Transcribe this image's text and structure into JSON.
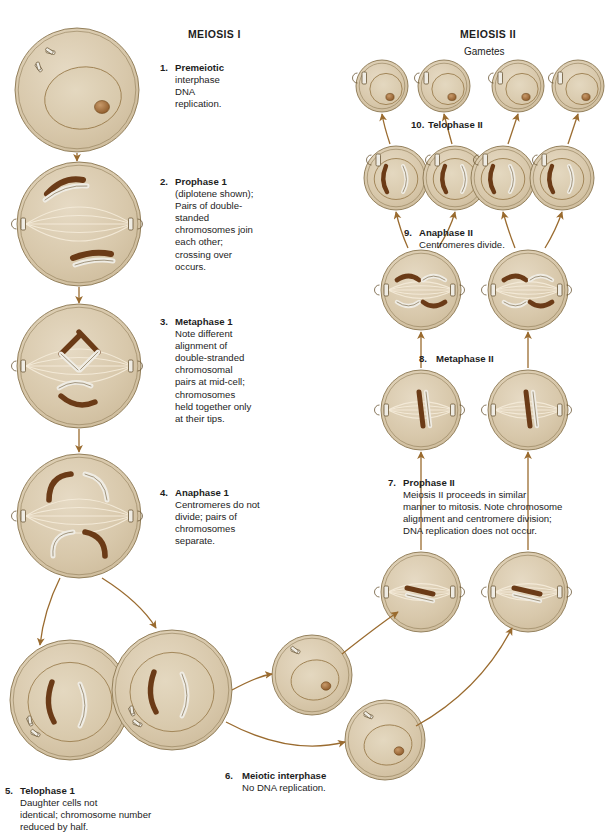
{
  "figure": {
    "title_left": "MEIOSIS I",
    "title_right": "MEIOSIS II",
    "subtitle_right": "Gametes"
  },
  "colors": {
    "cytoplasm": "#d9c9ad",
    "cytoplasm_light": "#e4d7bf",
    "nucleus": "#ded0b4",
    "membrane": "#8a7650",
    "chromosome_dark": "#6b3b17",
    "chromosome_light": "#efece4",
    "chromosome_outline": "#6b5736",
    "arrow": "#9a6b2f",
    "spindle": "#f3ead8",
    "text": "#1d1d1d",
    "background": "#ffffff"
  },
  "steps": [
    {
      "id": "step-1",
      "num": "1.",
      "title": "Premeiotic",
      "lines": [
        "interphase",
        "DNA",
        "replication."
      ]
    },
    {
      "id": "step-2",
      "num": "2.",
      "title": "Prophase 1",
      "lines": [
        "(diplotene shown);",
        "Pairs of double-",
        "standed",
        "chromosomes join",
        "each other;",
        "crossing over",
        "occurs."
      ]
    },
    {
      "id": "step-3",
      "num": "3.",
      "title": "Metaphase 1",
      "lines": [
        "Note different",
        "alignment of",
        "double-stranded",
        "chromosomal",
        "pairs at mid-cell;",
        "chromosomes",
        "held together only",
        "at their tips."
      ]
    },
    {
      "id": "step-4",
      "num": "4.",
      "title": "Anaphase 1",
      "lines": [
        "Centromeres do not",
        "divide; pairs of",
        "chromosomes",
        "separate."
      ]
    },
    {
      "id": "step-5",
      "num": "5.",
      "title": "Telophase 1",
      "lines": [
        "Daughter cells not",
        "identical; chromosome number",
        "reduced by half."
      ]
    },
    {
      "id": "step-6",
      "num": "6.",
      "title": "Meiotic interphase",
      "lines": [
        "No DNA replication."
      ]
    },
    {
      "id": "step-7",
      "num": "7.",
      "title": "Prophase II",
      "lines": [
        "Meiosis II proceeds in similar",
        "manner to mitosis. Note chromosome",
        "alignment and centromere division;",
        "DNA replication does not occur."
      ]
    },
    {
      "id": "step-8",
      "num": "8.",
      "title": "Metaphase II",
      "lines": []
    },
    {
      "id": "step-9",
      "num": "9.",
      "title": "Anaphase II",
      "lines": [
        "Centromeres divide."
      ]
    },
    {
      "id": "step-10",
      "num": "10.",
      "title": "Telophase II",
      "lines": []
    }
  ],
  "cells": [
    {
      "name": "premeiotic-interphase-cell",
      "stage": "1",
      "cx": 77,
      "cy": 90,
      "r": 62,
      "type": "interphase"
    },
    {
      "name": "prophase-1-cell",
      "stage": "2",
      "cx": 79,
      "cy": 224,
      "r": 62,
      "type": "prophase1"
    },
    {
      "name": "metaphase-1-cell",
      "stage": "3",
      "cx": 79,
      "cy": 366,
      "r": 62,
      "type": "metaphase1"
    },
    {
      "name": "anaphase-1-cell",
      "stage": "4",
      "cx": 79,
      "cy": 516,
      "r": 62,
      "type": "anaphase1"
    },
    {
      "name": "telophase-1-cell-left",
      "stage": "5",
      "cx": 70,
      "cy": 700,
      "r": 60,
      "type": "telophase1"
    },
    {
      "name": "telophase-1-cell-right",
      "stage": "5",
      "cx": 172,
      "cy": 690,
      "r": 60,
      "type": "telophase1"
    },
    {
      "name": "meiotic-interphase-cell-upper",
      "stage": "6",
      "cx": 312,
      "cy": 675,
      "r": 40,
      "type": "interphase-small"
    },
    {
      "name": "meiotic-interphase-cell-lower",
      "stage": "6",
      "cx": 385,
      "cy": 740,
      "r": 40,
      "type": "interphase-small"
    },
    {
      "name": "prophase-2-cell-left",
      "stage": "7",
      "cx": 421,
      "cy": 592,
      "r": 40,
      "type": "prophase2"
    },
    {
      "name": "prophase-2-cell-right",
      "stage": "7",
      "cx": 528,
      "cy": 592,
      "r": 40,
      "type": "prophase2"
    },
    {
      "name": "metaphase-2-cell-left",
      "stage": "8",
      "cx": 421,
      "cy": 410,
      "r": 40,
      "type": "metaphase2"
    },
    {
      "name": "metaphase-2-cell-right",
      "stage": "8",
      "cx": 528,
      "cy": 410,
      "r": 40,
      "type": "metaphase2"
    },
    {
      "name": "anaphase-2-cell-left",
      "stage": "9",
      "cx": 421,
      "cy": 290,
      "r": 40,
      "type": "anaphase2"
    },
    {
      "name": "anaphase-2-cell-right",
      "stage": "9",
      "cx": 528,
      "cy": 290,
      "r": 40,
      "type": "anaphase2"
    },
    {
      "name": "telophase-2-cell-left-a",
      "stage": "10",
      "cx": 396,
      "cy": 178,
      "r": 32,
      "type": "telophase2"
    },
    {
      "name": "telophase-2-cell-left-b",
      "stage": "10",
      "cx": 455,
      "cy": 178,
      "r": 32,
      "type": "telophase2"
    },
    {
      "name": "telophase-2-cell-right-a",
      "stage": "10",
      "cx": 503,
      "cy": 178,
      "r": 32,
      "type": "telophase2"
    },
    {
      "name": "telophase-2-cell-right-b",
      "stage": "10",
      "cx": 562,
      "cy": 178,
      "r": 32,
      "type": "telophase2"
    },
    {
      "name": "gamete-cell-1",
      "stage": "gamete",
      "cx": 382,
      "cy": 86,
      "r": 26,
      "type": "gamete"
    },
    {
      "name": "gamete-cell-2",
      "stage": "gamete",
      "cx": 444,
      "cy": 86,
      "r": 26,
      "type": "gamete"
    },
    {
      "name": "gamete-cell-3",
      "stage": "gamete",
      "cx": 518,
      "cy": 86,
      "r": 26,
      "type": "gamete"
    },
    {
      "name": "gamete-cell-4",
      "stage": "gamete",
      "cx": 578,
      "cy": 86,
      "r": 26,
      "type": "gamete"
    }
  ]
}
